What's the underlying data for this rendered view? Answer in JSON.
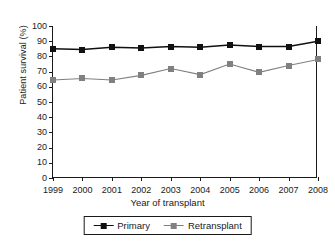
{
  "chart_data": {
    "type": "line",
    "title": "",
    "xlabel": "Year of transplant",
    "ylabel": "Patient survival (%)",
    "categories": [
      "1999",
      "2000",
      "2001",
      "2002",
      "2003",
      "2004",
      "2005",
      "2006",
      "2007",
      "2008"
    ],
    "x": [
      1999,
      2000,
      2001,
      2002,
      2003,
      2004,
      2005,
      2006,
      2007,
      2008
    ],
    "ylim": [
      0,
      100
    ],
    "yticks": [
      0,
      10,
      20,
      30,
      40,
      50,
      60,
      70,
      80,
      90,
      100
    ],
    "grid": false,
    "legend_position": "bottom-center",
    "series": [
      {
        "name": "Primary",
        "color": "#111111",
        "marker": "square",
        "values": [
          85,
          84.5,
          86,
          85.5,
          86.5,
          86,
          87.5,
          86.5,
          86.5,
          90
        ]
      },
      {
        "name": "Retransplant",
        "color": "#808080",
        "marker": "square",
        "values": [
          64.5,
          65.5,
          64.5,
          67.5,
          72,
          68,
          75,
          69.5,
          74,
          78
        ]
      }
    ]
  },
  "legend": {
    "items": [
      {
        "label": "Primary"
      },
      {
        "label": "Retransplant"
      }
    ]
  }
}
